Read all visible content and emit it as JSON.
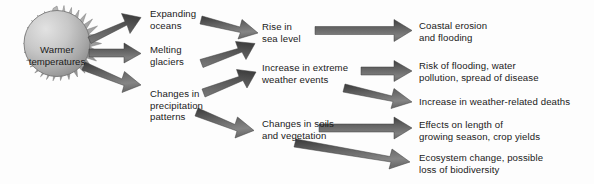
{
  "diagram": {
    "type": "flow-chart",
    "background_color": "#fdfdfd",
    "text_color": "#1a1a1a",
    "arrow_color_dark": "#4a4a4a",
    "arrow_color_light": "#8c8c8c",
    "sun_color_light": "#d8d8d8",
    "sun_color_dark": "#8f8f8f"
  },
  "source": {
    "id": "sun",
    "label": "Warmer\ntemperatures",
    "shape": "sun"
  },
  "level1": [
    {
      "id": "expanding-oceans",
      "label": "Expanding\noceans"
    },
    {
      "id": "melting-glaciers",
      "label": "Melting\nglaciers"
    },
    {
      "id": "changes-precipitation",
      "label": "Changes in\nprecipitation\npatterns"
    }
  ],
  "level2": [
    {
      "id": "rise-sea-level",
      "label": "Rise in\nsea level"
    },
    {
      "id": "increase-extreme-weather",
      "label": "Increase in extreme\nweather events"
    },
    {
      "id": "changes-soils-vegetation",
      "label": "Changes in soils\nand vegetation"
    }
  ],
  "level3": [
    {
      "id": "coastal-erosion",
      "label": "Coastal erosion\nand flooding"
    },
    {
      "id": "risk-flooding",
      "label": "Risk of flooding, water\npollution, spread of disease"
    },
    {
      "id": "weather-related-deaths",
      "label": "Increase in weather-related deaths"
    },
    {
      "id": "growing-season",
      "label": "Effects on length of\ngrowing season, crop yields"
    },
    {
      "id": "ecosystem-change",
      "label": "Ecosystem change, possible\nloss of biodiversity"
    }
  ],
  "connections": [
    {
      "from": "sun",
      "to": "expanding-oceans"
    },
    {
      "from": "sun",
      "to": "melting-glaciers"
    },
    {
      "from": "sun",
      "to": "changes-precipitation"
    },
    {
      "from": "expanding-oceans",
      "to": "rise-sea-level"
    },
    {
      "from": "melting-glaciers",
      "to": "rise-sea-level"
    },
    {
      "from": "changes-precipitation",
      "to": "increase-extreme-weather"
    },
    {
      "from": "changes-precipitation",
      "to": "changes-soils-vegetation"
    },
    {
      "from": "rise-sea-level",
      "to": "coastal-erosion"
    },
    {
      "from": "increase-extreme-weather",
      "to": "risk-flooding"
    },
    {
      "from": "increase-extreme-weather",
      "to": "weather-related-deaths"
    },
    {
      "from": "changes-soils-vegetation",
      "to": "growing-season"
    },
    {
      "from": "changes-soils-vegetation",
      "to": "ecosystem-change"
    }
  ]
}
